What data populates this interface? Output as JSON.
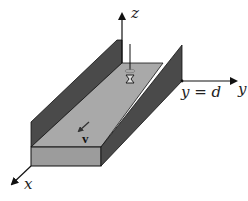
{
  "figure": {
    "axes": {
      "x": {
        "label": "x"
      },
      "y": {
        "label": "y"
      },
      "z": {
        "label": "z"
      }
    },
    "annotations": {
      "wall_position": "y = d",
      "velocity": "v"
    },
    "colors": {
      "wall_dark": "#4a4a4a",
      "floor_light": "#a9a9a9",
      "front_face": "#9c9c9c",
      "line": "#111111",
      "background": "#ffffff"
    }
  }
}
